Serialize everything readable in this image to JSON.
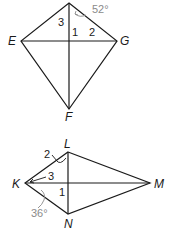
{
  "figures": [
    {
      "id": "kite-EFG",
      "vertices": {
        "top": {
          "label": "",
          "x": 69,
          "y": 3
        },
        "E": {
          "label": "E",
          "x": 21,
          "y": 41
        },
        "G": {
          "label": "G",
          "x": 117,
          "y": 41
        },
        "F": {
          "label": "F",
          "x": 69,
          "y": 109
        }
      },
      "angle_labels": {
        "a1": "1",
        "a2": "2",
        "a3": "3"
      },
      "given_angle": "52°"
    },
    {
      "id": "kite-KLMN",
      "vertices": {
        "L": {
          "label": "L",
          "x": 68,
          "y": 152
        },
        "K": {
          "label": "K",
          "x": 25,
          "y": 183
        },
        "M": {
          "label": "M",
          "x": 150,
          "y": 183
        },
        "N": {
          "label": "N",
          "x": 68,
          "y": 214
        }
      },
      "angle_labels": {
        "a1": "1",
        "a2": "2",
        "a3": "3"
      },
      "given_angle": "36°"
    }
  ],
  "colors": {
    "line": "#1a1a1a",
    "given_angle": "#8a8a8a"
  }
}
